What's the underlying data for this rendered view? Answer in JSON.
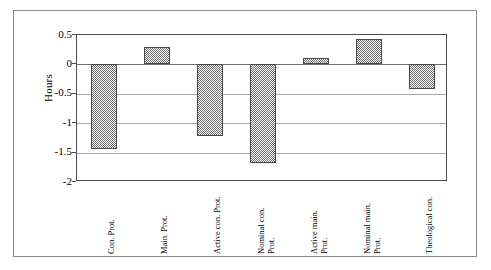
{
  "chart_data": {
    "type": "bar",
    "title": "",
    "xlabel": "",
    "ylabel": "Hours",
    "ylim": [
      -2,
      0.5
    ],
    "yticks": [
      0.5,
      0,
      -0.5,
      -1,
      -1.5,
      -2
    ],
    "ytick_labels": [
      "0.5",
      "0",
      "-0.5",
      "-1",
      "-1.5",
      "-2"
    ],
    "grid": true,
    "legend": "none",
    "categories": [
      "Con. Prot.",
      "Main. Prot.",
      "Active con. Prot.",
      "Nominal con. Prot.",
      "Active main. Prot.",
      "Nominal main. Prot.",
      "Theological con."
    ],
    "category_lines": [
      [
        "Con. Prot.",
        ""
      ],
      [
        "Main. Prot.",
        ""
      ],
      [
        "Active con. Prot.",
        ""
      ],
      [
        "Nominal con.",
        "Prot."
      ],
      [
        "Active main.",
        "Prot."
      ],
      [
        "Nominal main.",
        "Prot."
      ],
      [
        "Theological con.",
        ""
      ]
    ],
    "values": [
      -1.44,
      0.3,
      -1.22,
      -1.67,
      0.11,
      0.43,
      -0.42
    ],
    "bar_fill": "#6e6e6e",
    "bar_edge": "#4a4a4a",
    "gridline_color": "#a9a9a9",
    "axis_color": "#4d4d4d"
  },
  "figure": {
    "border_color": "#8a8a8a",
    "background": "#ffffff"
  }
}
